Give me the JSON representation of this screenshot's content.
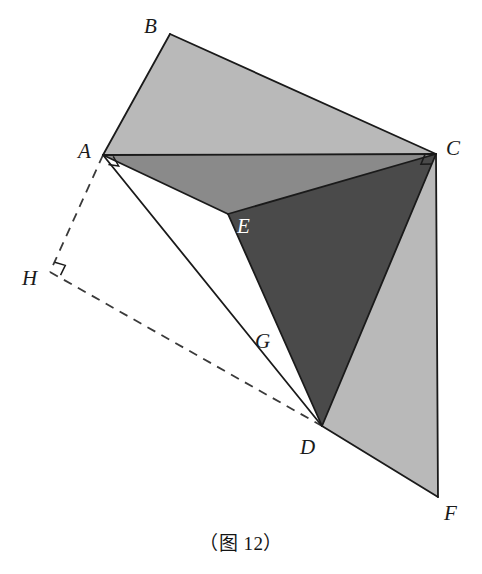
{
  "figure": {
    "caption": "（图 12）",
    "canvas": {
      "width": 482,
      "height": 574
    },
    "background_color": "#ffffff",
    "stroke_color": "#1a1a1a",
    "palette": {
      "light_gray": "#b9b9b9",
      "medium_gray": "#8a8a8a",
      "dark_gray": "#4a4a4a",
      "white": "#ffffff",
      "outline": "#1a1a1a",
      "dashed": "#3a3a3a"
    },
    "points": {
      "A": {
        "label": "A",
        "x": 103,
        "y": 155
      },
      "B": {
        "label": "B",
        "x": 170,
        "y": 34
      },
      "C": {
        "label": "C",
        "x": 436,
        "y": 154
      },
      "D": {
        "label": "D",
        "x": 322,
        "y": 426
      },
      "E": {
        "label": "E",
        "x": 228,
        "y": 214
      },
      "F": {
        "label": "F",
        "x": 438,
        "y": 497
      },
      "G": {
        "label": "G",
        "x": 277,
        "y": 347
      },
      "H": {
        "label": "H",
        "x": 50,
        "y": 272
      }
    },
    "label_positions": {
      "A": {
        "text": "A",
        "x": 78,
        "y": 141,
        "on_dark": false
      },
      "B": {
        "text": "B",
        "x": 144,
        "y": 16,
        "on_dark": false
      },
      "C": {
        "text": "C",
        "x": 446,
        "y": 138,
        "on_dark": false
      },
      "D": {
        "text": "D",
        "x": 300,
        "y": 437,
        "on_dark": false
      },
      "E": {
        "text": "E",
        "x": 237,
        "y": 216,
        "on_dark": true
      },
      "F": {
        "text": "F",
        "x": 444,
        "y": 503,
        "on_dark": false
      },
      "G": {
        "text": "G",
        "x": 255,
        "y": 331,
        "on_dark": false
      },
      "H": {
        "text": "H",
        "x": 22,
        "y": 268,
        "on_dark": false
      }
    },
    "regions": [
      {
        "name": "quad-ABCE-light",
        "fill": "#b9b9b9",
        "vertices": "A,B,C"
      },
      {
        "name": "tri-AEC-medium",
        "fill": "#8a8a8a",
        "vertices": "A,E,C"
      },
      {
        "name": "tri-CED-dark",
        "fill": "#4a4a4a",
        "vertices": "C,E,D"
      },
      {
        "name": "quad-CDF-light",
        "fill": "#b9b9b9",
        "vertices": "C,D,F"
      }
    ],
    "solid_edges": [
      {
        "name": "edge-AB",
        "from": "A",
        "to": "B"
      },
      {
        "name": "edge-BC",
        "from": "B",
        "to": "C"
      },
      {
        "name": "edge-AC",
        "from": "A",
        "to": "C"
      },
      {
        "name": "edge-AE",
        "from": "A",
        "to": "E"
      },
      {
        "name": "edge-EC",
        "from": "E",
        "to": "C"
      },
      {
        "name": "edge-ED",
        "from": "E",
        "to": "D"
      },
      {
        "name": "edge-CD",
        "from": "C",
        "to": "D"
      },
      {
        "name": "edge-AD",
        "from": "A",
        "to": "D"
      },
      {
        "name": "edge-DF",
        "from": "D",
        "to": "F"
      },
      {
        "name": "edge-CF",
        "from": "C",
        "to": "F"
      }
    ],
    "dashed_edges": [
      {
        "name": "edge-AH-dashed",
        "from": "A",
        "to": "H"
      },
      {
        "name": "edge-HD-dashed",
        "from": "H",
        "to": "D"
      }
    ],
    "right_angle_markers": [
      {
        "name": "right-angle-at-A",
        "at": "A"
      },
      {
        "name": "right-angle-at-C",
        "at": "C"
      },
      {
        "name": "right-angle-at-H",
        "at": "H"
      }
    ]
  }
}
